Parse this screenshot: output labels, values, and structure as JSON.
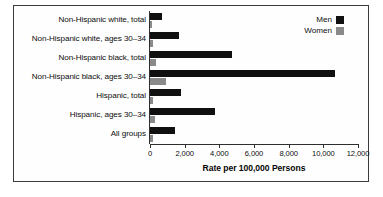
{
  "chart_data": {
    "type": "bar",
    "orientation": "horizontal",
    "title": "",
    "subtitle": "",
    "xlabel": "Rate per 100,000 Persons",
    "ylabel": "",
    "xlim": [
      0,
      12000
    ],
    "xticks": [
      "0",
      "2,000",
      "4,000",
      "6,000",
      "8,000",
      "10,000",
      "12,000"
    ],
    "xtick_values": [
      0,
      2000,
      4000,
      6000,
      8000,
      10000,
      12000
    ],
    "grid": false,
    "legend_position": "top-right",
    "categories": [
      "Non-Hispanic white, total",
      "Non-Hispanic white, ages 30–34",
      "Non-Hispanic black, total",
      "Non-Hispanic black, ages 30–34",
      "Hispanic, total",
      "Hispanic, ages 30–34",
      "All groups"
    ],
    "series": [
      {
        "name": "Men",
        "color": "#101010",
        "values": [
          700,
          1700,
          4750,
          10700,
          1800,
          3750,
          1450
        ]
      },
      {
        "name": "Women",
        "color": "#8a8a8a",
        "values": [
          100,
          200,
          350,
          900,
          150,
          300,
          150
        ]
      }
    ]
  },
  "legend": {
    "items": [
      {
        "label": "Men",
        "color": "#101010"
      },
      {
        "label": "Women",
        "color": "#8a8a8a"
      }
    ]
  },
  "colors": {
    "men": "#101010",
    "women": "#8a8a8a",
    "axis": "#2e2e2e",
    "frame": "#3b3b3b",
    "background": "#ffffff",
    "text": "#0d0d0d"
  }
}
